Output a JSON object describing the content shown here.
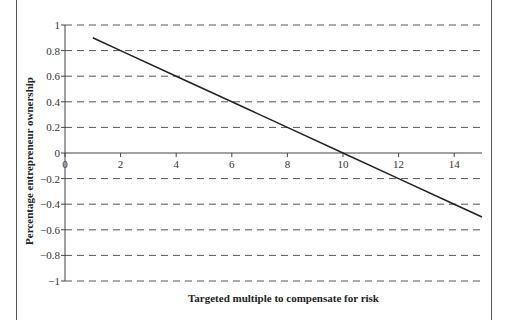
{
  "chart_data": {
    "type": "line",
    "title": "",
    "xlabel": "Targeted multiple to compensate for risk",
    "ylabel": "Percentage entrepreneur ownership",
    "xlim": [
      0,
      15
    ],
    "ylim": [
      -1,
      1
    ],
    "x_ticks": [
      0,
      2,
      4,
      6,
      8,
      10,
      12,
      14
    ],
    "x_tick_labels": [
      "0",
      "2",
      "4",
      "6",
      "8",
      "10",
      "12",
      "14"
    ],
    "y_ticks": [
      1,
      0.8,
      0.6,
      0.4,
      0.2,
      0,
      -0.2,
      -0.4,
      -0.6,
      -0.8,
      -1
    ],
    "y_tick_labels": [
      "1",
      "0.8",
      "0.6",
      "0.4",
      "0.2",
      "0",
      "−0.2",
      "−0.4",
      "−0.6",
      "−0.8",
      "−1"
    ],
    "grid": "horizontal-dashed",
    "legend": "none",
    "series": [
      {
        "name": "ownership",
        "x": [
          1,
          2,
          4,
          6,
          8,
          10,
          12,
          14,
          15
        ],
        "y": [
          0.9,
          0.8,
          0.6,
          0.4,
          0.2,
          0.0,
          -0.2,
          -0.4,
          -0.5
        ],
        "color": "#222222"
      }
    ]
  }
}
